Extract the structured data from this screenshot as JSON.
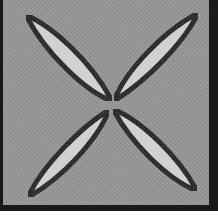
{
  "artwork": {
    "title": "Four-petal diagonal lens motif",
    "canvas": {
      "width": 218,
      "height": 216
    },
    "panel": {
      "name": "textured-gray-panel",
      "x": 3,
      "y": 0,
      "width": 212,
      "height": 210,
      "fill_color": "#8e8e8e",
      "texture": "fine-woven-noise",
      "texture_light": "#999999",
      "texture_dark": "#858585"
    },
    "frame": {
      "name": "panel-border",
      "color": "#1a1a1a",
      "left_width": 3,
      "right_width": 6,
      "bottom_width": 5,
      "top_width": 0,
      "outer_margin_color": "#ffffff"
    },
    "center_point": {
      "x": 110,
      "y": 105
    },
    "petals": [
      {
        "name": "petal-top-left",
        "fill_color": "#d2d2d2",
        "stroke_color": "#111111",
        "stroke_width": 5,
        "tip": {
          "x": 26,
          "y": 15
        },
        "angle_deg": 225,
        "length": 120,
        "width": 42
      },
      {
        "name": "petal-top-right",
        "fill_color": "#d2d2d2",
        "stroke_color": "#111111",
        "stroke_width": 5,
        "tip": {
          "x": 198,
          "y": 13
        },
        "angle_deg": 315,
        "length": 124,
        "width": 42
      },
      {
        "name": "petal-bottom-right",
        "fill_color": "#d2d2d2",
        "stroke_color": "#111111",
        "stroke_width": 5,
        "tip": {
          "x": 197,
          "y": 191
        },
        "angle_deg": 45,
        "length": 122,
        "width": 42
      },
      {
        "name": "petal-bottom-left",
        "fill_color": "#d2d2d2",
        "stroke_color": "#111111",
        "stroke_width": 5,
        "tip": {
          "x": 28,
          "y": 197
        },
        "angle_deg": 135,
        "length": 123,
        "width": 42
      }
    ],
    "colors": {
      "background_gray": "#8e8e8e",
      "petal_light_gray": "#d2d2d2",
      "outline_black": "#111111",
      "border_black": "#1a1a1a",
      "page_white": "#ffffff"
    }
  }
}
